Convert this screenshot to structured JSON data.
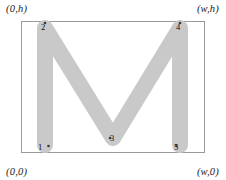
{
  "figure": {
    "type": "geometry-diagram",
    "colors": {
      "stroke": "#c9c9c9",
      "box_border": "#9a9a9a",
      "background": "#ffffff",
      "label_text": "#1a1a1a",
      "vertex_text": "#101010",
      "vertex_dot": "#3a3a3a"
    },
    "box": {
      "x": 21,
      "y": 21,
      "width": 183,
      "height": 131,
      "border_width": 1
    },
    "stroke_width": 16,
    "corner_labels": [
      {
        "name": "top-left",
        "text": "(0,h)"
      },
      {
        "name": "top-right",
        "text": "(w,h)"
      },
      {
        "name": "bottom-left",
        "text": "(0,0)"
      },
      {
        "name": "bottom-right",
        "text": "(w,0)"
      }
    ],
    "vertices": [
      {
        "id": "1",
        "label": "1",
        "x": 45,
        "y": 145,
        "dot_side": "right"
      },
      {
        "id": "2",
        "label": "2",
        "x": 45,
        "y": 28,
        "dot_side": "above"
      },
      {
        "id": "3",
        "label": "3",
        "x": 113,
        "y": 138,
        "dot_side": "left"
      },
      {
        "id": "4",
        "label": "4",
        "x": 180,
        "y": 28,
        "dot_side": "above"
      },
      {
        "id": "5",
        "label": "5",
        "x": 180,
        "y": 145,
        "dot_side": "left"
      }
    ],
    "polyline_points": "45,145 45,28 113,138 180,28 180,145"
  }
}
